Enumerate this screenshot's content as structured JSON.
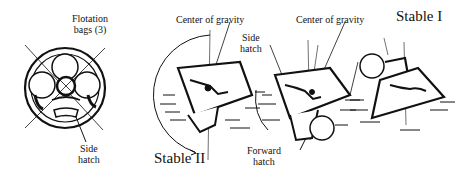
{
  "diagram": {
    "panels": [
      {
        "id": "top-view",
        "labels": {
          "flotation_bags": "Flotation",
          "flotation_bags_2": "bags (3)",
          "side_hatch": "Side",
          "side_hatch_2": "hatch"
        }
      },
      {
        "id": "stable-ii",
        "labels": {
          "center_of_gravity": "Center of gravity",
          "state": "Stable II"
        }
      },
      {
        "id": "transition",
        "labels": {
          "center_of_gravity": "Center of gravity",
          "side_hatch": "Side",
          "side_hatch_2": "hatch",
          "forward_hatch": "Forward",
          "forward_hatch_2": "hatch"
        }
      },
      {
        "id": "stable-i",
        "labels": {
          "state": "Stable I"
        }
      }
    ]
  }
}
